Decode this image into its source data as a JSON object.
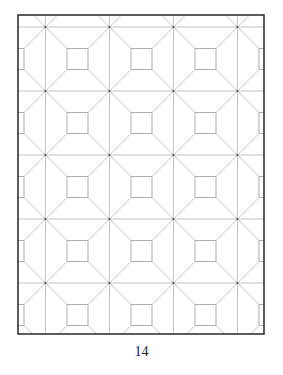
{
  "page": {
    "page_number": "14",
    "background": "#ffffff"
  },
  "figure": {
    "border": {
      "x": 18,
      "y": 15,
      "width": 246,
      "height": 319,
      "color": "#333333",
      "stroke_width": 1.6
    },
    "grid": {
      "node_origin_x": 45.5,
      "node_origin_y": 27,
      "period": 64,
      "node_cols": 4,
      "node_rows": 5,
      "line_color": "#b4b4b4",
      "line_width": 0.8,
      "node_dot_color": "#555555"
    },
    "squares": {
      "origin_x": 13.5,
      "origin_y": -5,
      "cols": 5,
      "rows": 6,
      "side": 21,
      "color": "#9a9a9a"
    }
  }
}
